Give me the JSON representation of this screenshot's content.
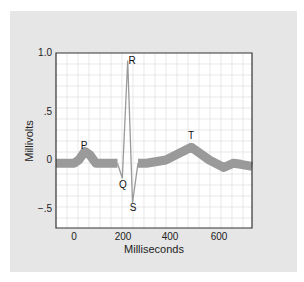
{
  "chart_data": {
    "type": "line",
    "title": "",
    "xlabel": "Milliseconds",
    "ylabel": "Millivolts",
    "xlim": [
      -75,
      737
    ],
    "ylim": [
      -0.7,
      1.0
    ],
    "x_ticks": [
      0,
      200,
      400,
      600
    ],
    "x_tick_labels": [
      "0",
      "200",
      "400",
      "600"
    ],
    "y_ticks": [
      1.0,
      0.5,
      0,
      -0.5
    ],
    "y_tick_labels": [
      "1.0",
      ".5",
      "0",
      "−.5"
    ],
    "grid": true,
    "legend": null,
    "series": [
      {
        "name": "ECG trace",
        "x": [
          -75,
          0,
          20,
          45,
          65,
          90,
          180,
          200,
          222,
          242,
          265,
          300,
          380,
          485,
          560,
          620,
          660,
          690,
          737
        ],
        "y": [
          -0.03,
          -0.03,
          0.0,
          0.08,
          0.05,
          -0.03,
          -0.03,
          -0.17,
          0.93,
          -0.4,
          -0.03,
          -0.03,
          0.0,
          0.12,
          0.0,
          -0.07,
          -0.03,
          -0.04,
          -0.06
        ]
      }
    ],
    "annotations": [
      {
        "text": "P",
        "x": 40,
        "y": 0.12
      },
      {
        "text": "Q",
        "x": 195,
        "y": -0.25
      },
      {
        "text": "R",
        "x": 225,
        "y": 0.98
      },
      {
        "text": "S",
        "x": 245,
        "y": -0.5
      },
      {
        "text": "T",
        "x": 485,
        "y": 0.17
      }
    ]
  },
  "labels": {
    "xlabel": "Milliseconds",
    "ylabel": "Millivolts",
    "x0": "0",
    "x200": "200",
    "x400": "400",
    "x600": "600",
    "y10": "1.0",
    "y05": ".5",
    "y0": "0",
    "ym05": "−.5",
    "P": "P",
    "Q": "Q",
    "R": "R",
    "S": "S",
    "T": "T"
  },
  "colors": {
    "panel_bg": "#e6e6e6",
    "plot_bg": "#ffffff",
    "grid": "#dcdcdc",
    "trace": "#9a9a9a",
    "axis": "#333333"
  }
}
